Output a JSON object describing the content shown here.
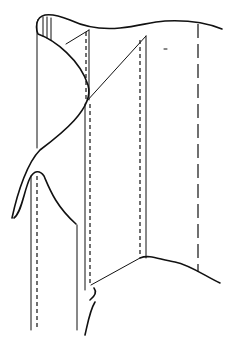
{
  "figure": {
    "colors": {
      "line": "#111111",
      "background": "#ffffff"
    },
    "elements": [
      "top-wavy-edge",
      "left-curl",
      "inner-panel",
      "diagonal-fold-top",
      "diagonal-fold-bottom",
      "right-long-dashed-line",
      "lower-left-tab",
      "bottom-wavy-edge"
    ]
  }
}
